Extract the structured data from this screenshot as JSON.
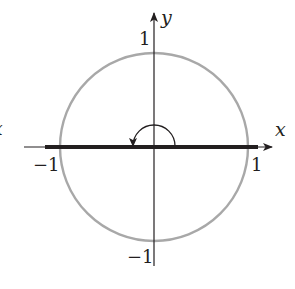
{
  "diagram": {
    "type": "unit-circle-with-angle",
    "axes": {
      "x_label": "x",
      "y_label": "y"
    },
    "ticks": {
      "x_pos": "1",
      "x_neg": "−1",
      "y_pos": "1",
      "y_neg": "−1"
    },
    "left_edge_fragment": "x",
    "colors": {
      "circle": "#a8a8a8",
      "axes": "#231f20",
      "segment": "#231f20",
      "text": "#231f20"
    },
    "elements": {
      "circle": "unit circle centered at origin",
      "segment": "thick horizontal segment along x-axis from -1 to 1",
      "angle_arc": "counterclockwise arc of 180 degrees with arrowhead"
    }
  }
}
